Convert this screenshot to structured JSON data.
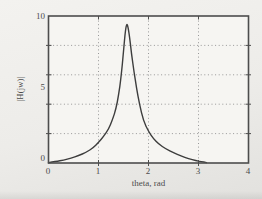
{
  "chart_data": {
    "type": "line",
    "title": "",
    "xlabel": "theta, rad",
    "ylabel": "|H(jw)|",
    "xlim": [
      0,
      4
    ],
    "ylim": [
      0,
      10
    ],
    "grid": "dotted",
    "legend": "none",
    "x_tick_labels": [
      "0",
      "1",
      "2",
      "3",
      "4"
    ],
    "x_tick_values": [
      0,
      1,
      2,
      3,
      4
    ],
    "y_tick_labels": [
      "0",
      "5",
      "10"
    ],
    "y_tick_values": [
      0,
      5,
      10
    ],
    "x_gridlines": [
      1,
      2,
      3
    ],
    "y_gridlines": [
      2,
      4,
      6,
      8
    ],
    "series": [
      {
        "name": "|H(jw)| magnitude response",
        "x": [
          0,
          0.15,
          0.3,
          0.45,
          0.6,
          0.75,
          0.9,
          1.0,
          1.1,
          1.2,
          1.28,
          1.35,
          1.4,
          1.45,
          1.5,
          1.54,
          1.57,
          1.61,
          1.66,
          1.71,
          1.76,
          1.82,
          1.9,
          2.0,
          2.1,
          2.2,
          2.35,
          2.5,
          2.65,
          2.8,
          2.95,
          3.05,
          3.16
        ],
        "y": [
          0.02,
          0.1,
          0.2,
          0.33,
          0.5,
          0.72,
          1.05,
          1.4,
          1.8,
          2.3,
          2.95,
          3.7,
          4.6,
          5.8,
          7.6,
          9.1,
          9.55,
          8.9,
          7.4,
          6.2,
          5.1,
          4.0,
          2.85,
          2.15,
          1.65,
          1.3,
          0.95,
          0.7,
          0.48,
          0.3,
          0.16,
          0.1,
          0.03
        ]
      }
    ],
    "peak": {
      "x": 1.57,
      "y": 9.55
    }
  },
  "colors": {
    "background": "#edece9",
    "paper": "#f6f5f2",
    "axis": "#4d4d4d",
    "grid": "#989898",
    "curve": "#3d3d3d",
    "text": "#4c4c4c"
  }
}
